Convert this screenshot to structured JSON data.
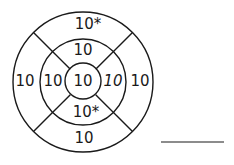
{
  "diagram": {
    "type": "target",
    "stroke_color": "#1a1a1a",
    "background": "#ffffff",
    "center": {
      "label": "10"
    },
    "middle_ring": {
      "top": "10",
      "right": "10",
      "bottom": "10*",
      "left": "10"
    },
    "outer_ring": {
      "top": "10*",
      "right": "10",
      "bottom": "10",
      "left": "10"
    },
    "answer_line": {
      "label": ""
    }
  }
}
